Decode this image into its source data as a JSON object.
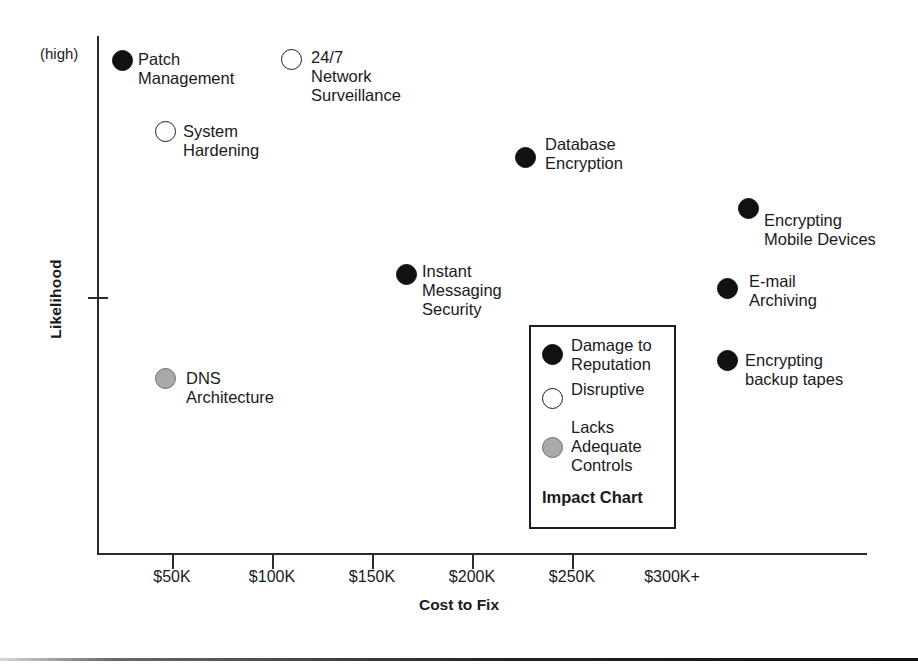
{
  "chart_data": {
    "type": "scatter",
    "title": "Impact Chart",
    "xlabel": "Cost to Fix",
    "ylabel": "Likelihood",
    "y_top_annotation": "(high)",
    "x_tick_labels": [
      "$50K",
      "$100K",
      "$150K",
      "$200K",
      "$250K",
      "$300K+"
    ],
    "x_tick_values": [
      50,
      100,
      150,
      200,
      250,
      300
    ],
    "xlim": [
      0,
      330
    ],
    "ylim": [
      0,
      10
    ],
    "grid": false,
    "legend_position": "inside-center-right",
    "legend": [
      {
        "key": "damage-to-reputation",
        "label": "Damage to\nReputation",
        "marker": "filled",
        "color": "#111111"
      },
      {
        "key": "disruptive",
        "label": "Disruptive",
        "marker": "open",
        "color": "#ffffff"
      },
      {
        "key": "lacks-adequate-controls",
        "label": "Lacks\nAdequate\nControls",
        "marker": "gray",
        "color": "#a9a9a9"
      }
    ],
    "points": [
      {
        "name": "Patch Management",
        "label": "Patch\nManagement",
        "category": "damage-to-reputation",
        "marker": "filled",
        "cost": 13,
        "likelihood": 9.7,
        "px": 122,
        "py": 60,
        "label_x": 138,
        "label_y": 50,
        "label_align": "left"
      },
      {
        "name": "24/7 Network Surveillance",
        "label": "24/7\nNetwork\nSurveillance",
        "category": "disruptive",
        "marker": "open",
        "cost": 97,
        "likelihood": 9.7,
        "px": 291,
        "py": 59,
        "label_x": 311,
        "label_y": 48,
        "label_align": "left"
      },
      {
        "name": "System Hardening",
        "label": "System\nHardening",
        "category": "disruptive",
        "marker": "open",
        "cost": 34,
        "likelihood": 8.2,
        "px": 165,
        "py": 131,
        "label_x": 183,
        "label_y": 122,
        "label_align": "left"
      },
      {
        "name": "Database Encryption",
        "label": "Database\nEncryption",
        "category": "damage-to-reputation",
        "marker": "filled",
        "cost": 214,
        "likelihood": 7.6,
        "px": 525,
        "py": 157,
        "label_x": 545,
        "label_y": 135,
        "label_align": "left"
      },
      {
        "name": "Encrypting Mobile Devices",
        "label": "Encrypting\nMobile Devices",
        "category": "damage-to-reputation",
        "marker": "filled",
        "cost": 325,
        "likelihood": 6.6,
        "px": 748,
        "py": 208,
        "label_x": 764,
        "label_y": 211,
        "label_align": "left"
      },
      {
        "name": "E-mail Archiving",
        "label": "E-mail\nArchiving",
        "category": "damage-to-reputation",
        "marker": "filled",
        "cost": 315,
        "likelihood": 5.1,
        "px": 727,
        "py": 288,
        "label_x": 749,
        "label_y": 272,
        "label_align": "left"
      },
      {
        "name": "Instant Messaging Security",
        "label": "Instant\nMessaging\nSecurity",
        "category": "damage-to-reputation",
        "marker": "filled",
        "cost": 153,
        "likelihood": 5.3,
        "px": 406,
        "py": 274,
        "label_x": 422,
        "label_y": 262,
        "label_align": "left"
      },
      {
        "name": "Encrypting backup tapes",
        "label": "Encrypting\nbackup tapes",
        "category": "damage-to-reputation",
        "marker": "filled",
        "cost": 315,
        "likelihood": 3.7,
        "px": 727,
        "py": 360,
        "label_x": 745,
        "label_y": 351,
        "label_align": "left"
      },
      {
        "name": "DNS Architecture",
        "label": "DNS\nArchitecture",
        "category": "lacks-adequate-controls",
        "marker": "gray",
        "cost": 34,
        "likelihood": 3.5,
        "px": 165,
        "py": 378,
        "label_x": 186,
        "label_y": 369,
        "label_align": "left"
      }
    ]
  }
}
